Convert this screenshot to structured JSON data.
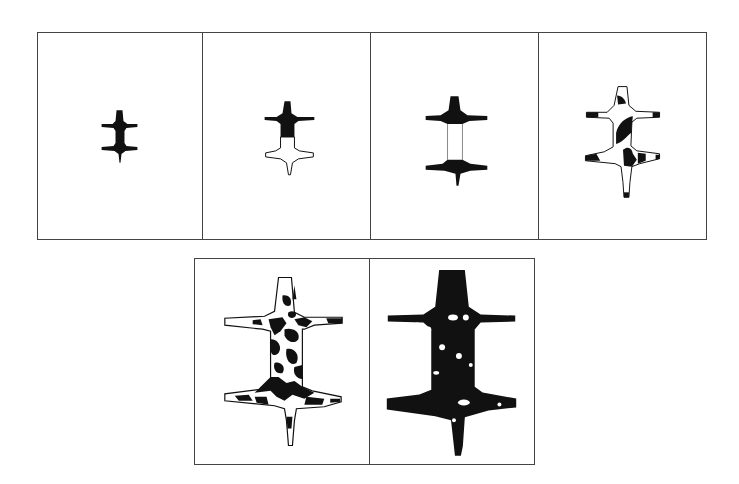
{
  "figure": {
    "rows": [
      {
        "panels": [
          {
            "index": 1,
            "state": "small fully black shape",
            "fill": "solid"
          },
          {
            "index": 2,
            "state": "upper half black, lower half white outline",
            "fill": "half"
          },
          {
            "index": 3,
            "state": "flanges black, central body white outline",
            "fill": "flanges"
          },
          {
            "index": 4,
            "state": "outlined shape with scattered black patches",
            "fill": "sparse-patches"
          }
        ]
      },
      {
        "panels": [
          {
            "index": 5,
            "state": "large shape with dense black/white mottling",
            "fill": "mottled"
          },
          {
            "index": 6,
            "state": "large nearly fully black shape with a few white spots",
            "fill": "mostly-solid"
          }
        ]
      }
    ],
    "colors": {
      "ink": "#111111",
      "paper": "#ffffff",
      "border": "#444444"
    }
  }
}
